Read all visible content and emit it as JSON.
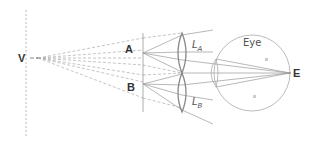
{
  "diagram": {
    "labels": {
      "V": "V",
      "A": "A",
      "B": "B",
      "E": "E",
      "eye": "Eye",
      "lens_a_main": "L",
      "lens_a_sub": "A",
      "lens_b_main": "L",
      "lens_b_sub": "B"
    },
    "colors": {
      "line": "#999999",
      "dashed": "#aaaaaa",
      "lens": "#888888",
      "text": "#333333"
    }
  }
}
